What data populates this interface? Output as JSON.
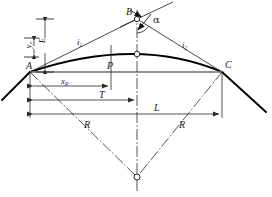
{
  "diagram": {
    "background_color": "#ffffff",
    "line_color": "#1a1a1a",
    "curve_color": "#000000",
    "dim_color": "#2a2a2a",
    "points": [
      {
        "id": "A",
        "label": "A",
        "x": 30,
        "y": 72,
        "label_x": 26,
        "label_y": 62,
        "marker": "none"
      },
      {
        "id": "B",
        "label": "B",
        "x": 137,
        "y": 19,
        "label_x": 126,
        "label_y": 8,
        "marker": "circle"
      },
      {
        "id": "C",
        "label": "C",
        "x": 222,
        "y": 72,
        "label_x": 224,
        "label_y": 61,
        "marker": "none"
      },
      {
        "id": "P",
        "label": "P",
        "x": 111,
        "y": 60,
        "label_x": 108,
        "label_y": 62,
        "marker": "none"
      },
      {
        "id": "M",
        "label": "",
        "x": 137,
        "y": 54,
        "label_x": 0,
        "label_y": 0,
        "marker": "circle"
      },
      {
        "id": "O",
        "label": "",
        "x": 137,
        "y": 177,
        "label_x": 0,
        "label_y": 0,
        "marker": "circle"
      }
    ],
    "labels": [
      {
        "name": "label-grade-in",
        "text": "i",
        "sub": "1",
        "x": 78,
        "y": 40,
        "size": "sz9",
        "rotated": false
      },
      {
        "name": "label-grade-out",
        "text": "i",
        "sub": "2",
        "x": 183,
        "y": 43,
        "size": "sz9",
        "rotated": false
      },
      {
        "name": "label-alpha",
        "text": "α",
        "sub": "",
        "x": 154,
        "y": 17,
        "size": "sz10",
        "rotated": false,
        "greek": true
      },
      {
        "name": "label-external-E",
        "text": "E",
        "sub": "",
        "x": 41,
        "y": 29,
        "size": "sz9",
        "rotated": true
      },
      {
        "name": "label-offset-yp",
        "text": "y",
        "sub": "P",
        "x": 27,
        "y": 35,
        "size": "sz8",
        "rotated": true
      },
      {
        "name": "label-distance-xp",
        "text": "x",
        "sub": "P",
        "x": 63,
        "y": 82,
        "size": "sz9",
        "rotated": false
      },
      {
        "name": "label-tangent-T",
        "text": "T",
        "sub": "",
        "x": 100,
        "y": 96,
        "size": "sz10",
        "rotated": false
      },
      {
        "name": "label-length-L",
        "text": "L",
        "sub": "",
        "x": 155,
        "y": 108,
        "size": "sz10",
        "rotated": false
      },
      {
        "name": "label-radius-left",
        "text": "R",
        "sub": "",
        "x": 85,
        "y": 125,
        "size": "sz10",
        "rotated": false
      },
      {
        "name": "label-radius-right",
        "text": "R",
        "sub": "",
        "x": 180,
        "y": 125,
        "size": "sz10",
        "rotated": false
      }
    ],
    "dimensions": [
      {
        "name": "dim-E",
        "orientation": "vertical",
        "from": 19,
        "to": 72,
        "axis": 45,
        "label": "E"
      },
      {
        "name": "dim-yp",
        "orientation": "vertical",
        "from": 38,
        "to": 57,
        "axis": 31,
        "label": "y_P"
      },
      {
        "name": "dim-xp",
        "orientation": "horizontal",
        "from": 30,
        "to": 111,
        "axis": 86,
        "label": "x_P"
      },
      {
        "name": "dim-T",
        "orientation": "horizontal",
        "from": 30,
        "to": 137,
        "axis": 100,
        "label": "T"
      },
      {
        "name": "dim-L",
        "orientation": "horizontal",
        "from": 30,
        "to": 222,
        "axis": 114,
        "label": "L"
      }
    ],
    "geometry_notes": {
      "chord_AC": "A(30,72) to C(222,72)",
      "tangent_in": "A(30,72) to B(137,19)",
      "tangent_out": "B(137,19) to C(222,72)",
      "curve_apex": "M(137,54)",
      "center_of_curvature": "O(137,177)",
      "vertical_axis": "x=137 from y=10 to y=190",
      "radius_left": "A(30,72) to O(137,177)",
      "radius_right": "C(222,72) to O(137,177)"
    }
  }
}
